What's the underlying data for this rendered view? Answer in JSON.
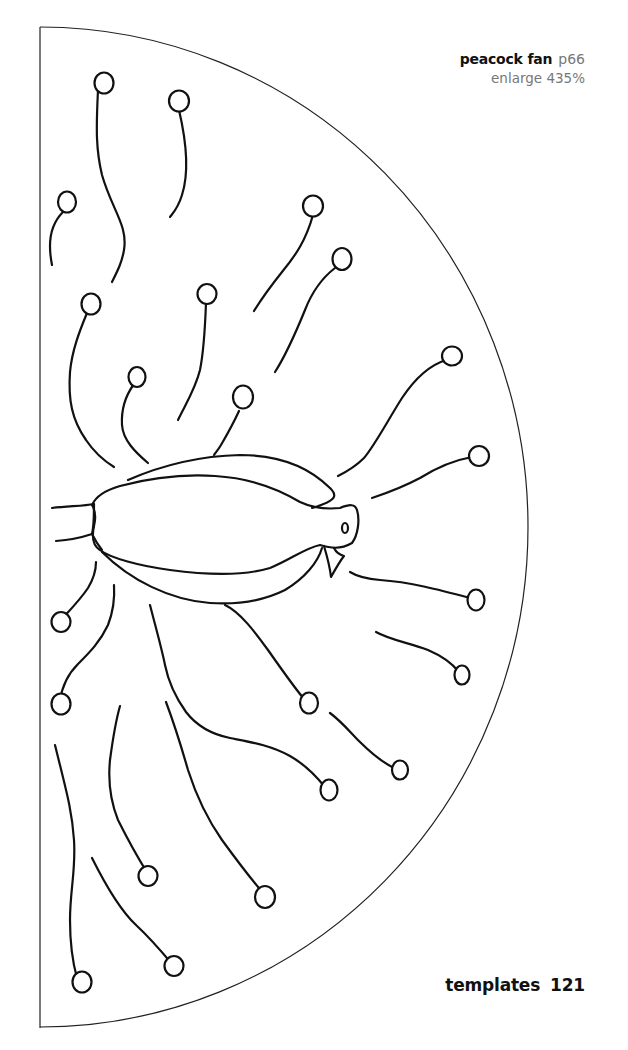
{
  "caption": {
    "title": "peacock fan",
    "page_ref": "p66",
    "enlarge": "enlarge 435%"
  },
  "footer": {
    "section": "templates",
    "page_number": "121"
  },
  "template": {
    "shape": "semicircle",
    "subject": "peacock",
    "feather_count": 24,
    "colors": {
      "ink": "#111111",
      "paper": "#ffffff",
      "caption_grey": "#777777"
    }
  }
}
